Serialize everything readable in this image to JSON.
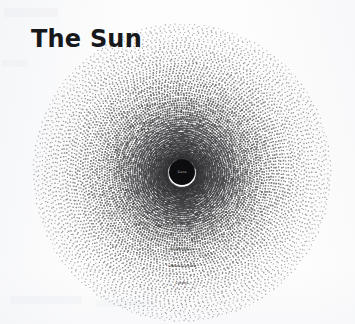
{
  "page": {
    "title": "The Sun",
    "background_color": "#fdfdfd",
    "ink_color": "#17181b"
  },
  "diagram": {
    "name": "sun-layers-concentric-dot-diagram",
    "center": {
      "x": 182,
      "y": 172
    },
    "core": {
      "label": "Core",
      "label_color": "#9a9a9a",
      "fill": "#0d0d0f",
      "radius": 13
    },
    "labels": [
      {
        "text": "Core",
        "radius": 0,
        "color": "#8d8d8d",
        "size": 3.3
      },
      {
        "text": "Radiative Zone",
        "radius": 20,
        "color": "#3a3a3a",
        "size": 3.0
      },
      {
        "text": "Convective Zone",
        "radius": 31,
        "color": "#3a3a3a",
        "size": 3.0
      },
      {
        "text": "Tachocline",
        "radius": 51,
        "color": "#3a3a3a",
        "size": 3.0
      },
      {
        "text": "Photosphere",
        "radius": 77,
        "color": "#3a3a3a",
        "size": 3.2
      },
      {
        "text": "Chromosphere",
        "radius": 94,
        "color": "#3a3a3a",
        "size": 3.2
      },
      {
        "text": "Corona",
        "radius": 111,
        "color": "#3a3a3a",
        "size": 3.2
      }
    ],
    "rings": {
      "count": 58,
      "inner_radius": 15,
      "outer_radius": 148,
      "dot_color": "#2b2b2e",
      "dot_min_size": 0.55,
      "dot_max_size": 1.15,
      "description": "concentric rings composed of tiny dots, dense near the core and progressively sparser and lighter toward the outer corona"
    }
  }
}
